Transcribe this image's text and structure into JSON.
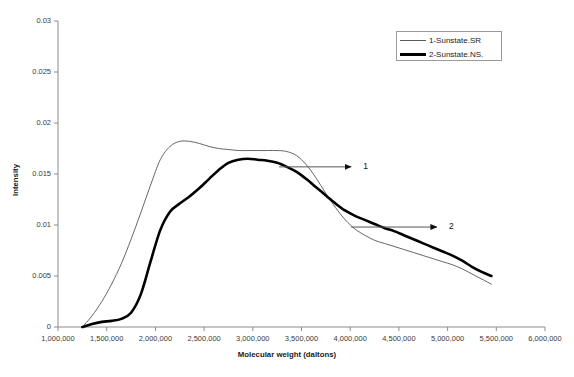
{
  "chart_data": {
    "type": "line",
    "title": "",
    "xlabel": "Molecular weight (daltons)",
    "ylabel": "Intensity",
    "xlim": [
      1000000,
      6000000
    ],
    "ylim": [
      0,
      0.03
    ],
    "grid": false,
    "legend_position": "top-right",
    "x_tick_labels": [
      "1,000,000",
      "1,500,000",
      "2,000,000",
      "2,500,000",
      "3,000,000",
      "3,500,000",
      "4,000,000",
      "4,500,000",
      "5,000,000",
      "5,500,000",
      "6,000,000"
    ],
    "x_ticks": [
      1000000,
      1500000,
      2000000,
      2500000,
      3000000,
      3500000,
      4000000,
      4500000,
      5000000,
      5500000,
      6000000
    ],
    "y_tick_labels": [
      "0",
      "0.005",
      "0.01",
      "0.015",
      "0.02",
      "0.025",
      "0.03"
    ],
    "y_ticks": [
      0,
      0.005,
      0.01,
      0.015,
      0.02,
      0.025,
      0.03
    ],
    "series": [
      {
        "name": "1-Sunstate.SR",
        "style": "thin",
        "color": "#555555",
        "annotation": "1",
        "x": [
          1250000,
          1350000,
          1450000,
          1550000,
          1650000,
          1750000,
          1850000,
          1950000,
          2050000,
          2150000,
          2250000,
          2350000,
          2450000,
          2550000,
          2650000,
          2750000,
          2850000,
          2950000,
          3050000,
          3150000,
          3250000,
          3350000,
          3450000,
          3550000,
          3650000,
          3750000,
          3850000,
          3950000,
          4050000,
          4150000,
          4250000,
          4350000,
          4450000,
          4550000,
          4650000,
          4750000,
          4850000,
          4950000,
          5050000,
          5150000,
          5250000,
          5350000,
          5450000
        ],
        "y": [
          0.0,
          0.0011,
          0.0025,
          0.0042,
          0.0062,
          0.0086,
          0.0112,
          0.0139,
          0.0164,
          0.0177,
          0.0182,
          0.0182,
          0.018,
          0.0177,
          0.0175,
          0.0174,
          0.0173,
          0.0173,
          0.0173,
          0.0173,
          0.0173,
          0.0172,
          0.0168,
          0.0159,
          0.0146,
          0.0131,
          0.0117,
          0.0105,
          0.0096,
          0.009,
          0.0085,
          0.0082,
          0.0079,
          0.0076,
          0.0073,
          0.007,
          0.0067,
          0.0064,
          0.0061,
          0.0057,
          0.0052,
          0.0047,
          0.0042
        ]
      },
      {
        "name": "2-Sunstate.NS.",
        "style": "thick",
        "color": "#000000",
        "annotation": "2",
        "x": [
          1250000,
          1350000,
          1450000,
          1550000,
          1650000,
          1750000,
          1850000,
          1950000,
          2050000,
          2150000,
          2250000,
          2350000,
          2450000,
          2550000,
          2650000,
          2750000,
          2850000,
          2950000,
          3050000,
          3150000,
          3250000,
          3350000,
          3450000,
          3550000,
          3650000,
          3750000,
          3850000,
          3950000,
          4050000,
          4150000,
          4250000,
          4350000,
          4450000,
          4550000,
          4650000,
          4750000,
          4850000,
          4950000,
          5050000,
          5150000,
          5250000,
          5350000,
          5450000
        ],
        "y": [
          0.0,
          0.0003,
          0.0005,
          0.0006,
          0.0008,
          0.0014,
          0.0032,
          0.0064,
          0.0095,
          0.0113,
          0.0121,
          0.0128,
          0.0136,
          0.0145,
          0.0154,
          0.0161,
          0.0164,
          0.0165,
          0.0164,
          0.0163,
          0.0161,
          0.0157,
          0.0152,
          0.0145,
          0.0137,
          0.0129,
          0.0121,
          0.0114,
          0.0109,
          0.0105,
          0.0101,
          0.0097,
          0.0094,
          0.009,
          0.0086,
          0.0082,
          0.0078,
          0.0074,
          0.007,
          0.0065,
          0.0059,
          0.0054,
          0.005
        ]
      }
    ],
    "annotations": [
      {
        "label": "1",
        "target_series": "1-Sunstate.SR",
        "arrow_from_x": 3270000,
        "arrow_from_y": 0.0157,
        "arrow_to_x": 4010000,
        "arrow_to_y": 0.0157
      },
      {
        "label": "2",
        "target_series": "2-Sunstate.NS.",
        "arrow_from_x": 4010000,
        "arrow_from_y": 0.0098,
        "arrow_to_x": 4890000,
        "arrow_to_y": 0.0098
      }
    ]
  },
  "legend": {
    "entries": [
      {
        "label": "1-Sunstate.SR"
      },
      {
        "label": "2-Sunstate.NS."
      }
    ]
  }
}
